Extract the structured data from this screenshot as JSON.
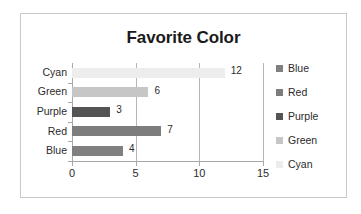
{
  "frame": {
    "border_color": "#c9c9c9",
    "background": "#ffffff"
  },
  "chart_data": {
    "type": "bar",
    "orientation": "horizontal",
    "title": "Favorite Color",
    "xlabel": "",
    "ylabel": "",
    "xlim": [
      0,
      15
    ],
    "xticks": [
      0,
      5,
      10,
      15
    ],
    "xtick_labels": [
      "0",
      "5",
      "10",
      "15"
    ],
    "grid": true,
    "grid_axis": "x",
    "legend_position": "right",
    "categories": [
      "Blue",
      "Red",
      "Purple",
      "Green",
      "Cyan"
    ],
    "values": [
      4,
      7,
      3,
      6,
      12
    ],
    "data_labels": [
      "4",
      "7",
      "3",
      "6",
      "12"
    ],
    "colors": [
      "#808080",
      "#7d7d7d",
      "#545454",
      "#c6c6c6",
      "#ededed"
    ],
    "axis_order_top_to_bottom": [
      "Cyan",
      "Green",
      "Purple",
      "Red",
      "Blue"
    ],
    "series_name": "Favorite Color"
  },
  "bars": [
    {
      "category": "Cyan",
      "value": 12,
      "label": "12",
      "color": "#ededed",
      "row": 0
    },
    {
      "category": "Green",
      "value": 6,
      "label": "6",
      "color": "#c6c6c6",
      "row": 1
    },
    {
      "category": "Purple",
      "value": 3,
      "label": "3",
      "color": "#545454",
      "row": 2
    },
    {
      "category": "Red",
      "value": 7,
      "label": "7",
      "color": "#7d7d7d",
      "row": 3
    },
    {
      "category": "Blue",
      "value": 4,
      "label": "4",
      "color": "#808080",
      "row": 4
    }
  ],
  "y_axis": {
    "labels": [
      "Cyan",
      "Green",
      "Purple",
      "Red",
      "Blue"
    ]
  },
  "x_axis": {
    "labels": [
      "0",
      "5",
      "10",
      "15"
    ],
    "values": [
      0,
      5,
      10,
      15
    ]
  },
  "legend": {
    "items": [
      {
        "label": "Blue",
        "color": "#808080"
      },
      {
        "label": "Red",
        "color": "#7d7d7d"
      },
      {
        "label": "Purple",
        "color": "#545454"
      },
      {
        "label": "Green",
        "color": "#c6c6c6"
      },
      {
        "label": "Cyan",
        "color": "#ededed"
      }
    ]
  }
}
